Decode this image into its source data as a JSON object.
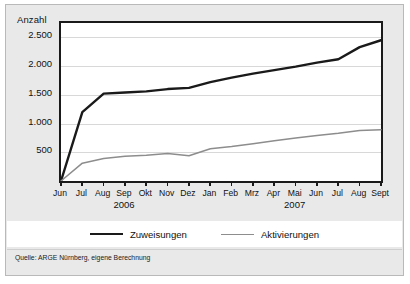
{
  "figure": {
    "y_axis_title": "Anzahl",
    "source_note": "Quelle: ARGE Nürnberg, eigene Berechnung"
  },
  "colors": {
    "series_zuweisungen": "#1a1a1a",
    "series_aktivierungen": "#8d8d8d",
    "grid": "#d8d8d8",
    "axis": "#1a1a1a",
    "figure_background": "#e9e9e9",
    "plot_background": "#ffffff"
  },
  "chart_data": {
    "type": "line",
    "title": "",
    "xlabel": "",
    "ylabel": "Anzahl",
    "ylim": [
      0,
      2750
    ],
    "yticks": [
      500,
      1000,
      1500,
      2000,
      2500
    ],
    "ytick_labels": [
      "500",
      "1.000",
      "1.500",
      "2.000",
      "2.500"
    ],
    "grid": true,
    "legend_position": "bottom",
    "categories": [
      "Jun",
      "Jul",
      "Aug",
      "Sep",
      "Okt",
      "Nov",
      "Dez",
      "Jan",
      "Feb",
      "Mrz",
      "Apr",
      "Mai",
      "Jun",
      "Jul",
      "Aug",
      "Sept"
    ],
    "year_groups": [
      {
        "label": "2006",
        "from": "Jun",
        "to": "Dez"
      },
      {
        "label": "2007",
        "from": "Jan",
        "to": "Sept"
      }
    ],
    "series": [
      {
        "name": "Zuweisungen",
        "color": "#1a1a1a",
        "width": 2.4,
        "values": [
          0,
          1200,
          1520,
          1540,
          1560,
          1600,
          1620,
          1720,
          1800,
          1870,
          1930,
          1990,
          2060,
          2120,
          2330,
          2450
        ]
      },
      {
        "name": "Aktivierungen",
        "color": "#8d8d8d",
        "width": 1.5,
        "values": [
          0,
          310,
          390,
          430,
          450,
          480,
          440,
          560,
          600,
          650,
          700,
          750,
          790,
          830,
          880,
          890
        ]
      }
    ]
  }
}
